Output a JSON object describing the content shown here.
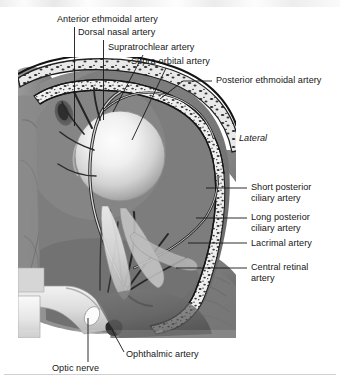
{
  "figure": {
    "orientation_label": "Lateral",
    "style": {
      "background": "#ffffff",
      "text_color": "#161616",
      "leader_line_color": "#1a1a1a",
      "illustration_palette": "grayscale"
    }
  },
  "labels": {
    "anterior_ethmoidal": "Anterior ethmoidal artery",
    "dorsal_nasal": "Dorsal nasal artery",
    "supratrochlear": "Supratrochlear artery",
    "supraorbital": "Supra-orbital artery",
    "posterior_ethmoidal": "Posterior ethmoidal artery",
    "lateral": "Lateral",
    "short_posterior_ciliary_line1": "Short posterior",
    "short_posterior_ciliary_line2": "ciliary artery",
    "long_posterior_ciliary_line1": "Long posterior",
    "long_posterior_ciliary_line2": "ciliary artery",
    "lacrimal": "Lacrimal artery",
    "central_retinal_line1": "Central retinal",
    "central_retinal_line2": "artery",
    "ophthalmic": "Ophthalmic artery",
    "optic_nerve": "Optic nerve"
  },
  "structures": [
    {
      "name": "anterior-ethmoidal-artery",
      "side": "top"
    },
    {
      "name": "dorsal-nasal-artery",
      "side": "top"
    },
    {
      "name": "supratrochlear-artery",
      "side": "top"
    },
    {
      "name": "supra-orbital-artery",
      "side": "top"
    },
    {
      "name": "posterior-ethmoidal-artery",
      "side": "top-right"
    },
    {
      "name": "short-posterior-ciliary-artery",
      "side": "right"
    },
    {
      "name": "long-posterior-ciliary-artery",
      "side": "right"
    },
    {
      "name": "lacrimal-artery",
      "side": "right"
    },
    {
      "name": "central-retinal-artery",
      "side": "right"
    },
    {
      "name": "ophthalmic-artery",
      "side": "bottom"
    },
    {
      "name": "optic-nerve",
      "side": "bottom"
    }
  ]
}
